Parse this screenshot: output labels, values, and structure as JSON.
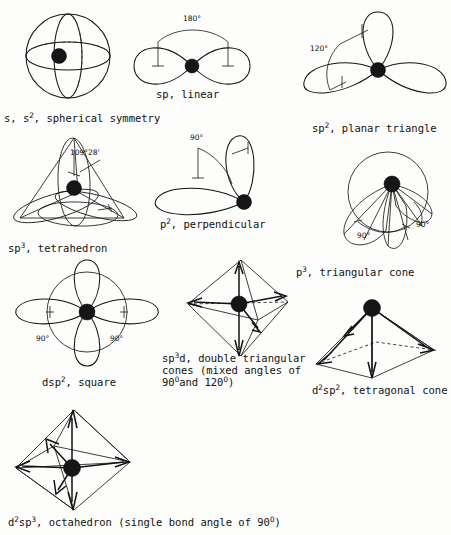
{
  "document": {
    "title": "Orbital hybridization geometries",
    "background_color": "#fdfdfb",
    "ink_color": "#141414"
  },
  "figures": [
    {
      "id": "s-orbital",
      "shape": "sphere",
      "caption_prefix": "s, s",
      "caption_sup": "2",
      "caption_suffix": ", spherical symmetry",
      "caption_full": "s, s2, spherical symmetry",
      "angles": []
    },
    {
      "id": "sp-linear",
      "shape": "two-lobe",
      "caption_prefix": "sp, linear",
      "caption_sup": "",
      "caption_suffix": "",
      "caption_full": "sp, linear",
      "angles": [
        "180°"
      ]
    },
    {
      "id": "sp2-planar-triangle",
      "shape": "three-lobe",
      "caption_prefix": "sp",
      "caption_sup": "2",
      "caption_suffix": ", planar triangle",
      "caption_full": "sp2, planar triangle",
      "angles": [
        "120°"
      ]
    },
    {
      "id": "sp3-tetrahedron",
      "shape": "tetrahedral-lobes",
      "caption_prefix": "sp",
      "caption_sup": "3",
      "caption_suffix": ", tetrahedron",
      "caption_full": "sp3, tetrahedron",
      "angles": [
        "109°28'"
      ]
    },
    {
      "id": "p2-perpendicular",
      "shape": "two-lobe-perpendicular",
      "caption_prefix": "p",
      "caption_sup": "2",
      "caption_suffix": ", perpendicular",
      "caption_full": "p2, perpendicular",
      "angles": [
        "90°"
      ]
    },
    {
      "id": "p3-triangular-cone",
      "shape": "three-cone",
      "caption_prefix": "p",
      "caption_sup": "3",
      "caption_suffix": ", triangular cone",
      "caption_full": "p3, triangular cone",
      "angles": [
        "90°",
        "90°"
      ]
    },
    {
      "id": "dsp2-square",
      "shape": "four-lobe-square",
      "caption_prefix": "dsp",
      "caption_sup": "2",
      "caption_suffix": ", square",
      "caption_full": "dsp2, square",
      "angles": [
        "90°",
        "90°"
      ]
    },
    {
      "id": "sp3d-double-triangular-cones",
      "shape": "trigonal-bipyramid",
      "caption_prefix": "sp",
      "caption_sup": "3",
      "caption_suffix": "d, double triangular",
      "caption_line2": "cones (mixed angles of",
      "caption_line3_prefix": "90",
      "caption_line3_sup1": "O",
      "caption_line3_mid": "and 120",
      "caption_line3_sup2": "O",
      "caption_line3_suffix": ")",
      "caption_full": "sp3d, double triangular cones (mixed angles of 90O and 120O)",
      "angles": []
    },
    {
      "id": "d2sp2-tetragonal-cone",
      "shape": "square-pyramid",
      "caption_prefix": "d",
      "caption_sup": "2",
      "caption_mid": "sp",
      "caption_sup2": "2",
      "caption_suffix": ", tetragonal cone",
      "caption_full": "d2sp2, tetragonal cone",
      "angles": []
    },
    {
      "id": "d2sp3-octahedron",
      "shape": "octahedron",
      "caption_prefix": "d",
      "caption_sup": "2",
      "caption_mid": "sp",
      "caption_sup2": "3",
      "caption_suffix": ", octahedron (single bond angle of 90",
      "caption_sup3": "O",
      "caption_end": ")",
      "caption_full": "d2sp3, octahedron (single bond angle of 90O)",
      "angles": [
        "90°"
      ]
    }
  ]
}
